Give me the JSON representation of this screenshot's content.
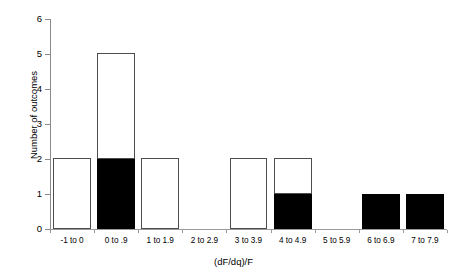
{
  "chart_data": {
    "type": "bar",
    "title": "",
    "xlabel": "(dF/dq)/F",
    "ylabel": "Number of outcomes",
    "categories": [
      "-1 to 0",
      "0 to .9",
      "1 to 1.9",
      "2 to 2.9",
      "3 to 3.9",
      "4 to 4.9",
      "5 to 5.9",
      "6 to 6.9",
      "7 to 7.9"
    ],
    "values": [
      2,
      5,
      2,
      0,
      2,
      2,
      0,
      1,
      1
    ],
    "stacked": true,
    "series": [
      {
        "name": "filled",
        "fill": "#000000",
        "values": [
          0,
          2,
          0,
          0,
          0,
          1,
          0,
          1,
          1
        ]
      },
      {
        "name": "unfilled",
        "fill": "#ffffff",
        "values": [
          2,
          3,
          2,
          0,
          2,
          1,
          0,
          0,
          0
        ]
      }
    ],
    "ylim": [
      0,
      6
    ],
    "yticks": [
      "0",
      "1",
      "2",
      "3",
      "4",
      "5",
      "6"
    ],
    "ytick_values": [
      0,
      1,
      2,
      3,
      4,
      5,
      6
    ],
    "grid": false,
    "legend": "none"
  },
  "axes": {
    "y_label": "Number of outcomes",
    "x_label": "(dF/dq)/F"
  }
}
